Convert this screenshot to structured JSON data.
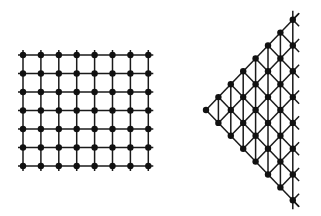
{
  "diagrams": [
    {
      "name": "square-lattice",
      "type": "square-grid",
      "columns": 8,
      "rows": 7,
      "origin": [
        23,
        55
      ],
      "step_x": 17.9,
      "step_y": 18.5,
      "overhang": 5
    },
    {
      "name": "triangular-lattice",
      "type": "triangle-grid",
      "columns": 8,
      "apex": [
        206,
        110
      ],
      "step_x": 12.4,
      "step_y": 12.9,
      "overhang": 9
    }
  ],
  "colors": {
    "line": "#1a1a1a",
    "node": "#111111",
    "background": "#ffffff"
  },
  "node_radius": 3.2
}
